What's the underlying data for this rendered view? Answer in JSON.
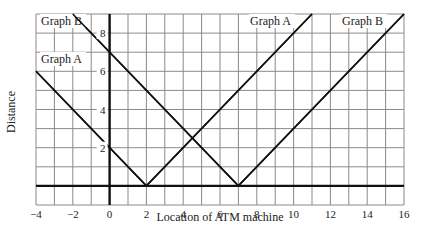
{
  "chart_data": {
    "type": "line",
    "title": "",
    "xlabel": "Location of ATM machine",
    "ylabel": "Distance",
    "xlim": [
      -4,
      16
    ],
    "ylim": [
      -1,
      9
    ],
    "grid": true,
    "x_ticks": [
      -4,
      -2,
      0,
      2,
      4,
      6,
      8,
      10,
      12,
      14,
      16
    ],
    "y_ticks": [
      2,
      4,
      6,
      8
    ],
    "series": [
      {
        "name": "Graph A",
        "formula": "y = |x - 2|",
        "points": [
          [
            -4,
            6
          ],
          [
            2,
            0
          ],
          [
            11,
            9
          ]
        ]
      },
      {
        "name": "Graph B",
        "formula": "y = |x - 7|",
        "points": [
          [
            -2,
            9
          ],
          [
            7,
            0
          ],
          [
            16,
            9
          ]
        ]
      }
    ],
    "annotations": [
      {
        "text": "Graph B",
        "position": "top-left"
      },
      {
        "text": "Graph A",
        "position": "left, near y=6.5"
      },
      {
        "text": "Graph A",
        "position": "top, near x=9"
      },
      {
        "text": "Graph B",
        "position": "top-right, near x=14"
      }
    ]
  }
}
